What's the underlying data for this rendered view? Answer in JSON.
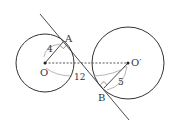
{
  "diagram": {
    "type": "geometry",
    "circles": [
      {
        "name": "O",
        "cx": 45,
        "cy": 63,
        "r": 29
      },
      {
        "name": "O'",
        "cx": 128,
        "cy": 63,
        "r": 36
      }
    ],
    "tangent_line": {
      "x1": 40,
      "y1": 14,
      "x2": 129,
      "y2": 120
    },
    "points": {
      "A": {
        "x": 63,
        "y": 42
      },
      "B": {
        "x": 104,
        "y": 88
      }
    },
    "labels": {
      "O": "O",
      "O_prime": "O′",
      "A": "A",
      "B": "B",
      "radius_O": "4",
      "radius_O_prime": "5",
      "distance_OO": "12"
    },
    "colors": {
      "stroke": "#333333",
      "dashed": "#444444",
      "arc": "#888888"
    }
  }
}
